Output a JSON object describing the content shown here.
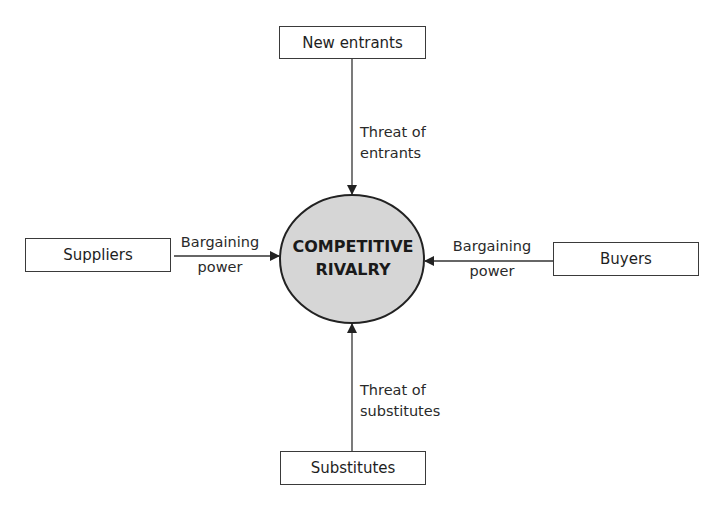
{
  "diagram": {
    "center": {
      "line1": "COMPETITIVE",
      "line2": "RIVALRY",
      "fill": "#d6d6d6"
    },
    "nodes": {
      "top": {
        "label": "New entrants"
      },
      "left": {
        "label": "Suppliers"
      },
      "right": {
        "label": "Buyers"
      },
      "bottom": {
        "label": "Substitutes"
      }
    },
    "edges": {
      "top": {
        "line1": "Threat of",
        "line2": "entrants"
      },
      "left": {
        "line1": "Bargaining",
        "line2": "power"
      },
      "right": {
        "line1": "Bargaining",
        "line2": "power"
      },
      "bottom": {
        "line1": "Threat of",
        "line2": "substitutes"
      }
    }
  }
}
